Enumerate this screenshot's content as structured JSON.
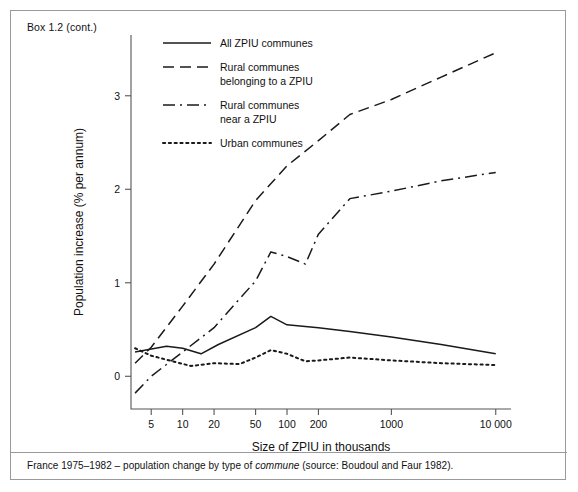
{
  "box": {
    "title": "Box 1.2  (cont.)",
    "caption_pre": "France 1975–1982 – population change by type of ",
    "caption_italic": "commune",
    "caption_post": " (source: Boudoul and Faur 1982)."
  },
  "chart_data": {
    "type": "line",
    "title": "",
    "xlabel": "Size of ZPIU in thousands",
    "ylabel": "Population increase (% per annum)",
    "xscale": "log",
    "xlim": [
      3.2,
      14000
    ],
    "ylim": [
      -0.35,
      3.65
    ],
    "xticks": [
      5,
      10,
      20,
      50,
      100,
      200,
      1000,
      10000
    ],
    "xticklabels": [
      "5",
      "10",
      "20",
      "50",
      "100",
      "200",
      "1000",
      "10 000"
    ],
    "yticks": [
      0,
      1,
      2,
      3
    ],
    "yticklabels": [
      "0",
      "1",
      "2",
      "3"
    ],
    "grid": false,
    "legend_position": "top-center",
    "series": [
      {
        "name": "All ZPIU communes",
        "style": "solid",
        "color": "#1a1a1a",
        "x": [
          3.5,
          7,
          10,
          15,
          22,
          50,
          70,
          100,
          200,
          400,
          1000,
          3000,
          10000
        ],
        "y": [
          0.26,
          0.32,
          0.3,
          0.24,
          0.34,
          0.52,
          0.64,
          0.55,
          0.52,
          0.48,
          0.42,
          0.34,
          0.24
        ]
      },
      {
        "name": "Rural communes belonging to a ZPIU",
        "style": "dashed",
        "color": "#1a1a1a",
        "x": [
          3.5,
          5,
          10,
          20,
          50,
          100,
          200,
          400,
          1000,
          3000,
          10000
        ],
        "y": [
          0.14,
          0.31,
          0.75,
          1.2,
          1.88,
          2.25,
          2.52,
          2.8,
          2.96,
          3.2,
          3.46
        ]
      },
      {
        "name": "Rural communes near a ZPIU",
        "style": "dashdot",
        "color": "#1a1a1a",
        "x": [
          3.5,
          5,
          10,
          20,
          50,
          70,
          100,
          150,
          200,
          400,
          1000,
          3000,
          10000
        ],
        "y": [
          -0.18,
          0.0,
          0.26,
          0.52,
          1.02,
          1.33,
          1.28,
          1.2,
          1.52,
          1.9,
          1.98,
          2.09,
          2.18
        ]
      },
      {
        "name": "Urban communes",
        "style": "dotted",
        "color": "#1a1a1a",
        "x": [
          3.5,
          5,
          8,
          12,
          20,
          35,
          50,
          70,
          100,
          150,
          200,
          400,
          1000,
          3000,
          10000
        ],
        "y": [
          0.3,
          0.22,
          0.16,
          0.11,
          0.14,
          0.13,
          0.2,
          0.28,
          0.24,
          0.16,
          0.17,
          0.2,
          0.17,
          0.14,
          0.12
        ]
      }
    ],
    "legend": [
      {
        "label_lines": [
          "All ZPIU communes"
        ],
        "style": "solid"
      },
      {
        "label_lines": [
          "Rural communes",
          "belonging to a ZPIU"
        ],
        "style": "dashed"
      },
      {
        "label_lines": [
          "Rural communes",
          "near a ZPIU"
        ],
        "style": "dashdot"
      },
      {
        "label_lines": [
          "Urban communes"
        ],
        "style": "dotted"
      }
    ]
  }
}
